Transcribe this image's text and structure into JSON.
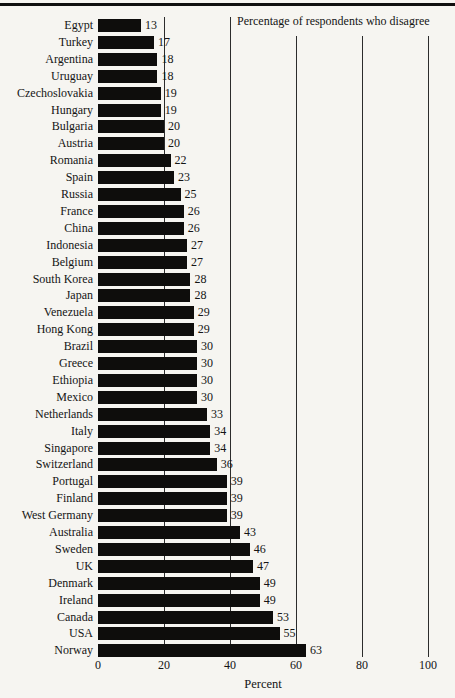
{
  "page": {
    "background": "#f6f5f1",
    "rule_color": "#101010",
    "text_color": "#141414",
    "gridline_color": "#2c2c2c"
  },
  "chart_data": {
    "type": "bar",
    "orientation": "horizontal",
    "annotation": "Percentage of respondents who disagree",
    "xlabel": "Percent",
    "xlim": [
      0,
      100
    ],
    "xticks": [
      0,
      20,
      40,
      60,
      80,
      100
    ],
    "grid": true,
    "bar_color": "#0e0d0c",
    "categories": [
      "Egypt",
      "Turkey",
      "Argentina",
      "Uruguay",
      "Czechoslovakia",
      "Hungary",
      "Bulgaria",
      "Austria",
      "Romania",
      "Spain",
      "Russia",
      "France",
      "China",
      "Indonesia",
      "Belgium",
      "South Korea",
      "Japan",
      "Venezuela",
      "Hong Kong",
      "Brazil",
      "Greece",
      "Ethiopia",
      "Mexico",
      "Netherlands",
      "Italy",
      "Singapore",
      "Switzerland",
      "Portugal",
      "Finland",
      "West Germany",
      "Australia",
      "Sweden",
      "UK",
      "Denmark",
      "Ireland",
      "Canada",
      "USA",
      "Norway"
    ],
    "values": [
      13,
      17,
      18,
      18,
      19,
      19,
      20,
      20,
      22,
      23,
      25,
      26,
      26,
      27,
      27,
      28,
      28,
      29,
      29,
      30,
      30,
      30,
      30,
      33,
      34,
      34,
      36,
      39,
      39,
      39,
      43,
      46,
      47,
      49,
      49,
      53,
      55,
      63
    ]
  }
}
